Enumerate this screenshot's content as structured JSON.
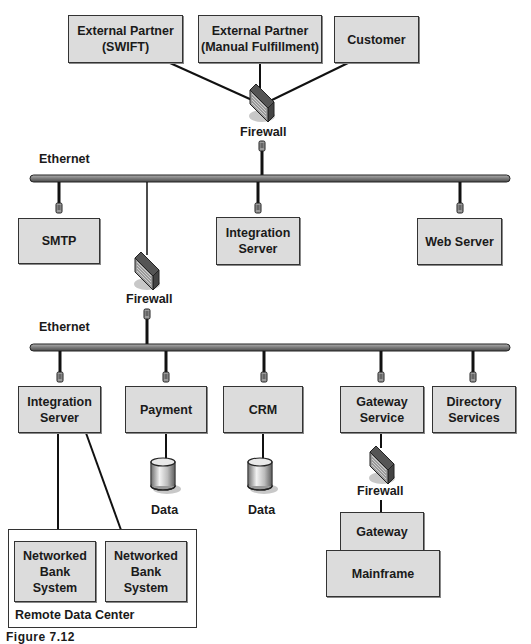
{
  "diagram": {
    "external_nodes": [
      {
        "id": "ext-swift",
        "label": "External Partner\n(SWIFT)"
      },
      {
        "id": "ext-manual",
        "label": "External Partner\n(Manual Fulfillment)"
      },
      {
        "id": "customer",
        "label": "Customer"
      }
    ],
    "firewalls": {
      "top": "Firewall",
      "middle": "Firewall",
      "gateway": "Firewall"
    },
    "networks": {
      "upper": "Ethernet",
      "lower": "Ethernet"
    },
    "dmz_nodes": [
      {
        "id": "smtp",
        "label": "SMTP"
      },
      {
        "id": "integration-server-dmz",
        "label": "Integration\nServer"
      },
      {
        "id": "web-server",
        "label": "Web Server"
      }
    ],
    "internal_nodes": [
      {
        "id": "integration-server-internal",
        "label": "Integration\nServer"
      },
      {
        "id": "payment",
        "label": "Payment"
      },
      {
        "id": "crm",
        "label": "CRM"
      },
      {
        "id": "gateway-service",
        "label": "Gateway\nService"
      },
      {
        "id": "directory-services",
        "label": "Directory\nServices"
      }
    ],
    "databases": [
      {
        "id": "payment-data",
        "label": "Data"
      },
      {
        "id": "crm-data",
        "label": "Data"
      }
    ],
    "mainframe_stack": {
      "gateway": "Gateway",
      "mainframe": "Mainframe"
    },
    "remote_data_center": {
      "label": "Remote Data Center",
      "systems": [
        {
          "label": "Networked\nBank\nSystem"
        },
        {
          "label": "Networked\nBank\nSystem"
        }
      ]
    },
    "caption": "Figure 7.12"
  },
  "colors": {
    "box_fill": "#dcdcdc",
    "border": "#333333",
    "bus": "#8c8c8c"
  }
}
